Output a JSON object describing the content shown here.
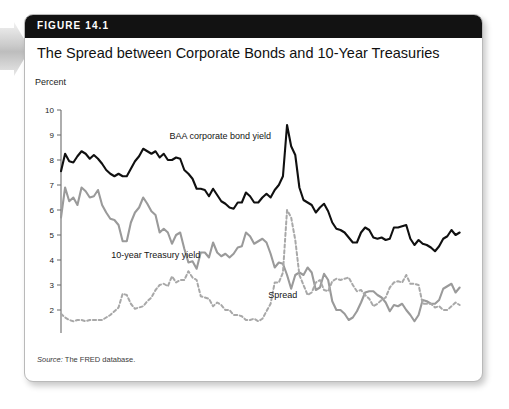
{
  "figure": {
    "number_label": "FIGURE 14.1",
    "title": "The Spread between Corporate Bonds and 10-Year Treasuries",
    "source_prefix": "Source:",
    "source_text": "The FRED database.",
    "unit_label": "Percent"
  },
  "icons": {
    "left_arrow": "right-arrow-icon"
  },
  "colors": {
    "header_bar": "#121212",
    "baa_line": "#101010",
    "treasury_line": "#9a9a9a",
    "spread_line": "#a8a8a8",
    "axis": "#6b6b6b",
    "card_border": "#b9b9b9"
  },
  "chart_data": {
    "type": "line",
    "title": "The Spread between Corporate Bonds and 10-Year Treasuries",
    "xlabel": "Year",
    "ylabel": "Percent",
    "xlim": [
      1995,
      2020
    ],
    "ylim": [
      1,
      10
    ],
    "grid": false,
    "legend": "inline-annotations",
    "xticks": [
      1995,
      2000,
      2005,
      2010,
      2015,
      2020
    ],
    "yticks": [
      1,
      2,
      3,
      4,
      5,
      6,
      7,
      8,
      9,
      10
    ],
    "x": [
      1995.0,
      1995.25,
      1995.5,
      1995.75,
      1996.0,
      1996.25,
      1996.5,
      1996.75,
      1997.0,
      1997.25,
      1997.5,
      1997.75,
      1998.0,
      1998.25,
      1998.5,
      1998.75,
      1999.0,
      1999.25,
      1999.5,
      1999.75,
      2000.0,
      2000.25,
      2000.5,
      2000.75,
      2001.0,
      2001.25,
      2001.5,
      2001.75,
      2002.0,
      2002.25,
      2002.5,
      2002.75,
      2003.0,
      2003.25,
      2003.5,
      2003.75,
      2004.0,
      2004.25,
      2004.5,
      2004.75,
      2005.0,
      2005.25,
      2005.5,
      2005.75,
      2006.0,
      2006.25,
      2006.5,
      2006.75,
      2007.0,
      2007.25,
      2007.5,
      2007.75,
      2008.0,
      2008.25,
      2008.5,
      2008.75,
      2009.0,
      2009.25,
      2009.5,
      2009.75,
      2010.0,
      2010.25,
      2010.5,
      2010.75,
      2011.0,
      2011.25,
      2011.5,
      2011.75,
      2012.0,
      2012.25,
      2012.5,
      2012.75,
      2013.0,
      2013.25,
      2013.5,
      2013.75,
      2014.0,
      2014.25,
      2014.5,
      2014.75,
      2015.0,
      2015.25,
      2015.5,
      2015.75,
      2016.0,
      2016.25,
      2016.5,
      2016.75,
      2017.0,
      2017.25,
      2017.5,
      2017.75,
      2018.0,
      2018.25,
      2018.5,
      2018.75,
      2019.0,
      2019.25
    ],
    "series": [
      {
        "name": "BAA corporate bond yield",
        "style": "solid",
        "color": "#101010",
        "label_x": 2001.6,
        "label_y": 8.85,
        "values": [
          7.55,
          8.25,
          7.95,
          7.9,
          8.15,
          8.35,
          8.25,
          8.05,
          8.2,
          8.05,
          7.85,
          7.6,
          7.45,
          7.35,
          7.45,
          7.35,
          7.35,
          7.65,
          7.95,
          8.15,
          8.45,
          8.35,
          8.25,
          8.35,
          8.1,
          8.25,
          8.0,
          8.0,
          8.1,
          8.05,
          7.6,
          7.45,
          7.25,
          6.85,
          6.85,
          6.8,
          6.55,
          6.85,
          6.6,
          6.35,
          6.25,
          6.1,
          6.05,
          6.3,
          6.3,
          6.7,
          6.55,
          6.3,
          6.3,
          6.5,
          6.65,
          6.5,
          6.8,
          7.0,
          7.35,
          9.4,
          8.55,
          8.2,
          6.9,
          6.4,
          6.3,
          6.2,
          5.9,
          6.1,
          6.25,
          5.95,
          5.5,
          5.25,
          5.2,
          5.1,
          4.9,
          4.7,
          4.7,
          5.1,
          5.3,
          5.2,
          4.9,
          4.85,
          4.9,
          4.8,
          4.85,
          5.3,
          5.3,
          5.35,
          5.4,
          4.85,
          4.6,
          4.8,
          4.65,
          4.6,
          4.5,
          4.35,
          4.55,
          4.85,
          4.95,
          5.2,
          5.0,
          5.1
        ]
      },
      {
        "name": "10-year Treasury yield",
        "style": "solid",
        "color": "#9a9a9a",
        "label_x": 1998.05,
        "label_y": 4.08,
        "values": [
          5.7,
          6.9,
          6.35,
          6.5,
          6.2,
          6.9,
          6.75,
          6.5,
          6.55,
          6.8,
          6.2,
          5.9,
          5.65,
          5.6,
          5.4,
          4.75,
          4.75,
          5.5,
          5.9,
          6.1,
          6.5,
          6.25,
          5.95,
          5.8,
          5.1,
          5.25,
          5.1,
          4.65,
          5.0,
          5.1,
          4.45,
          3.9,
          3.95,
          3.65,
          4.3,
          4.3,
          4.1,
          4.7,
          4.3,
          4.15,
          4.25,
          4.1,
          4.25,
          4.5,
          4.55,
          5.1,
          4.95,
          4.65,
          4.75,
          4.85,
          4.7,
          4.25,
          3.7,
          3.9,
          3.85,
          3.4,
          2.85,
          3.4,
          3.5,
          3.4,
          3.7,
          3.5,
          2.8,
          2.9,
          3.45,
          3.2,
          2.35,
          2.0,
          2.0,
          1.85,
          1.6,
          1.7,
          1.95,
          2.3,
          2.7,
          2.75,
          2.75,
          2.6,
          2.5,
          2.3,
          1.95,
          2.2,
          2.15,
          2.25,
          2.0,
          1.8,
          1.55,
          1.8,
          2.4,
          2.35,
          2.25,
          2.25,
          2.4,
          2.85,
          2.95,
          3.05,
          2.7,
          2.9
        ]
      },
      {
        "name": "Spread",
        "style": "dashed",
        "color": "#a8a8a8",
        "label_x": 2007.6,
        "label_y": 2.5,
        "values": [
          1.85,
          1.7,
          1.6,
          1.55,
          1.6,
          1.6,
          1.55,
          1.6,
          1.6,
          1.6,
          1.6,
          1.7,
          1.8,
          1.95,
          2.1,
          2.65,
          2.6,
          2.25,
          2.05,
          2.1,
          2.15,
          2.35,
          2.5,
          2.8,
          3.0,
          3.05,
          2.95,
          3.35,
          3.1,
          3.2,
          3.2,
          3.55,
          3.3,
          3.2,
          2.55,
          2.5,
          2.45,
          2.15,
          2.3,
          2.2,
          2.0,
          2.0,
          1.8,
          1.8,
          1.75,
          1.6,
          1.6,
          1.65,
          1.55,
          1.65,
          1.95,
          2.25,
          3.1,
          3.1,
          3.5,
          6.0,
          5.7,
          4.8,
          3.4,
          3.0,
          2.6,
          2.7,
          3.1,
          3.2,
          2.8,
          2.75,
          3.15,
          3.25,
          3.2,
          3.25,
          3.3,
          3.0,
          2.75,
          2.8,
          2.6,
          2.45,
          2.15,
          2.25,
          2.4,
          2.5,
          2.9,
          3.1,
          3.15,
          3.1,
          3.4,
          3.05,
          3.05,
          3.0,
          2.25,
          2.25,
          2.25,
          2.1,
          2.15,
          2.0,
          2.0,
          2.15,
          2.3,
          2.2
        ]
      }
    ]
  }
}
